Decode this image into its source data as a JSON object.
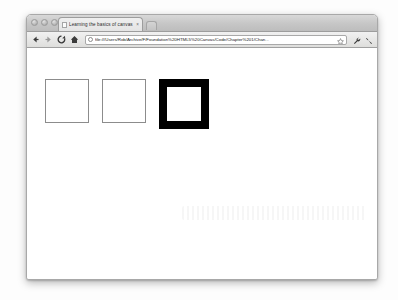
{
  "window": {
    "traffic_lights": [
      "close",
      "minimize",
      "zoom"
    ],
    "new_tab_label": "+"
  },
  "tab": {
    "favicon": "page-icon",
    "title": "Learning the basics of canvas",
    "close_label": "×"
  },
  "toolbar": {
    "back_label": "Back",
    "forward_label": "Forward",
    "reload_label": "Reload",
    "home_label": "Home",
    "bookmark_label": "Bookmark this page",
    "wrench_label": "Customize and control",
    "tools_label": "Tools"
  },
  "omnibox": {
    "url": "file:///Users/Rob/Archive/F/Foundation%20HTML5%20Canvas/Code/Chapter%201/Chan...",
    "placeholder": "Search or type URL",
    "security_icon": "page-info-icon"
  },
  "canvas": {
    "description": "Three stroked squares drawn on an HTML5 canvas",
    "shapes": [
      {
        "name": "square-thin-gray-1",
        "size": 44,
        "stroke_color": "#8c8c8c",
        "stroke_width": 1,
        "fill_color": "#ffffff"
      },
      {
        "name": "square-thin-gray-2",
        "size": 44,
        "stroke_color": "#8c8c8c",
        "stroke_width": 1,
        "fill_color": "#ffffff"
      },
      {
        "name": "square-thick-black",
        "size": 50,
        "stroke_color": "#000000",
        "stroke_width": 8,
        "fill_color": "#ffffff"
      }
    ]
  }
}
